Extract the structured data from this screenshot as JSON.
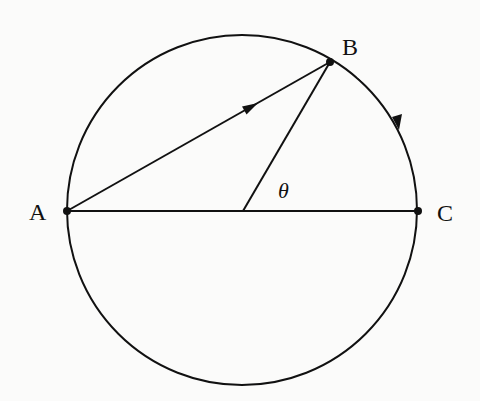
{
  "diagram": {
    "type": "geometry",
    "colors": {
      "stroke": "#111111",
      "background": "#fbfbfa"
    },
    "circle": {
      "cx": 242,
      "cy": 211,
      "r": 175
    },
    "points": [
      {
        "id": "A",
        "label": "A",
        "x": 67,
        "y": 211
      },
      {
        "id": "B",
        "label": "B",
        "x": 330,
        "y": 62
      },
      {
        "id": "C",
        "label": "C",
        "x": 418,
        "y": 211
      },
      {
        "id": "O",
        "label": "",
        "x": 242,
        "y": 211
      }
    ],
    "segments": [
      {
        "from": "A",
        "to": "C",
        "kind": "diameter"
      },
      {
        "from": "A",
        "to": "B",
        "kind": "arrow-chord"
      },
      {
        "from": "O",
        "to": "B",
        "kind": "radius"
      }
    ],
    "arc_arrow": {
      "from": "B",
      "to": "C",
      "direction": "clockwise"
    },
    "angle_label": {
      "text": "θ",
      "at": "O",
      "between": [
        "OB",
        "OC"
      ]
    },
    "labels": {
      "A": "A",
      "B": "B",
      "C": "C",
      "theta": "θ"
    }
  }
}
